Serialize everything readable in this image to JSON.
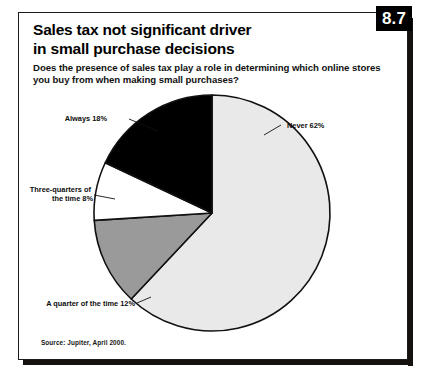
{
  "figure": {
    "number": "8.7",
    "title_line1": "Sales tax not significant driver",
    "title_line2": "in small purchase decisions",
    "subtitle_line1": "Does the presence of sales tax play a role in determining which online stores you buy",
    "subtitle_line2": "from when making small purchases?",
    "source": "Source: Jupiter, April 2000."
  },
  "chart_data": {
    "type": "pie",
    "title": "Sales tax not significant driver in small purchase decisions",
    "subtitle": "Does the presence of sales tax play a role in determining which online stores you buy from when making small purchases?",
    "categories": [
      "Never",
      "A quarter of the time",
      "Three-quarters of the time",
      "Always"
    ],
    "values": [
      62,
      12,
      8,
      18
    ],
    "unit": "%",
    "start_angle_deg": 0,
    "direction": "clockwise",
    "legend": "none",
    "grid": false,
    "colors": [
      "#e9e9e9",
      "#9a9a9a",
      "#ffffff",
      "#000000"
    ],
    "slices": [
      {
        "label": "Never",
        "value": 62,
        "label_text": "Never 62%",
        "color": "#e9e9e9",
        "label_lines": [
          "Never 62%"
        ]
      },
      {
        "label": "A quarter of the time",
        "value": 12,
        "label_text": "A quarter of the time 12%",
        "color": "#9a9a9a",
        "label_lines": [
          "A quarter of the time 12%"
        ]
      },
      {
        "label": "Three-quarters of the time",
        "value": 8,
        "label_text": "Three-quarters of the time 8%",
        "color": "#ffffff",
        "label_lines": [
          "Three-quarters of",
          "the time 8%"
        ]
      },
      {
        "label": "Always",
        "value": 18,
        "label_text": "Always 18%",
        "color": "#000000",
        "label_lines": [
          "Always 18%"
        ]
      }
    ]
  }
}
